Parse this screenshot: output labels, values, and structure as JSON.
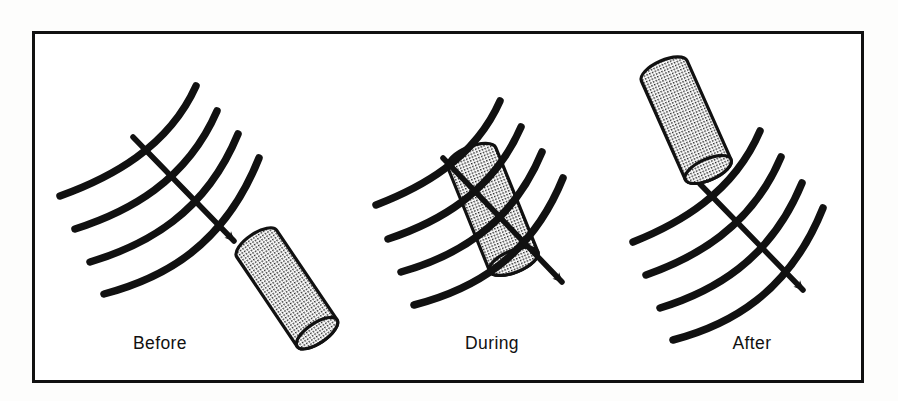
{
  "figure": {
    "type": "technical-line-diagram",
    "background_color": "#fdfdfc",
    "ink_color": "#111111",
    "frame": {
      "name": "figure-border",
      "x": 32,
      "y": 31,
      "width": 831,
      "height": 351,
      "stroke_width": 3,
      "color": "#111111",
      "fill": "#ffffff"
    },
    "stipple": {
      "pattern": "fine-dot-grid",
      "pitch_px": 3,
      "dot_color": "#1a1a1a",
      "background": "#ffffff"
    },
    "line_style": {
      "curve_stroke_width": 7.5,
      "arrow_stroke_width": 5.5,
      "cylinder_outline_width": 3.2,
      "linecap": "round"
    },
    "panels": [
      {
        "id": "before",
        "label": "Before",
        "label_x": 160,
        "label_y": 349,
        "state": "cylinder approaching the layers, not yet in contact",
        "cylinder_position": "lower-right of layers, outside",
        "arrow_direction": "down-right"
      },
      {
        "id": "during",
        "label": "During",
        "label_x": 492,
        "label_y": 349,
        "state": "cylinder embedded within the layers, lines crossing over it",
        "cylinder_position": "centered on the layers, intersected",
        "arrow_direction": "down-right"
      },
      {
        "id": "after",
        "label": "After",
        "label_x": 752,
        "label_y": 349,
        "state": "cylinder has passed through and sits above the layers",
        "cylinder_position": "upper-left of layers, outside",
        "arrow_direction": "down-right"
      }
    ],
    "curve_count_per_panel": 4,
    "arrow_count_per_panel": 1
  }
}
